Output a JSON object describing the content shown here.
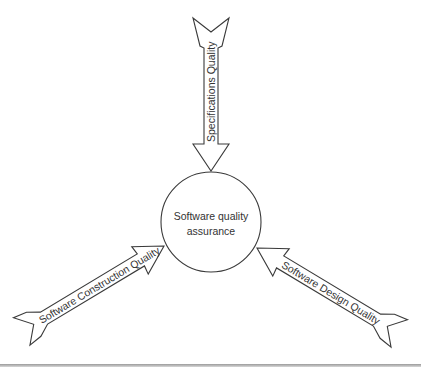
{
  "diagram": {
    "center": {
      "line1": "Software quality",
      "line2": "assurance"
    },
    "arrows": [
      {
        "id": "top",
        "label": "Specifications Quality"
      },
      {
        "id": "left",
        "label": "Software Construction Quality"
      },
      {
        "id": "right",
        "label": "Software Design Quality"
      }
    ]
  },
  "colors": {
    "stroke": "#3a3a3a",
    "text": "#333333",
    "background": "#ffffff"
  }
}
